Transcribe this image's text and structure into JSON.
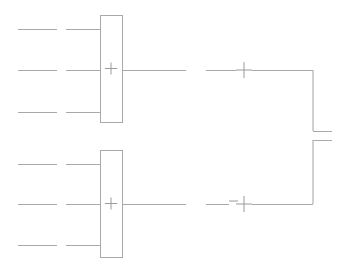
{
  "diagram": {
    "type": "block-diagram",
    "canvas": {
      "width": 346,
      "height": 269,
      "background": "#ffffff"
    },
    "colors": {
      "wire": "#a9a9a9",
      "block_stroke": "#a9a9a9",
      "block_fill": "#ffffff",
      "glyph": "#8a8a8a",
      "background": "#ffffff"
    },
    "stages": [
      {
        "id": "upper",
        "label": "Upper summing stage",
        "summing_block": {
          "name": "upper-summing-block",
          "operator": "+",
          "x": 100,
          "y": 15,
          "width": 22,
          "height": 107
        },
        "inputs": [
          {
            "name": "upper-input-1",
            "row": 1,
            "y": 29,
            "far_segment": {
              "x1": 18,
              "x2": 57
            },
            "near_segment": {
              "x1": 66,
              "x2": 100
            }
          },
          {
            "name": "upper-input-2",
            "row": 2,
            "y": 70,
            "far_segment": {
              "x1": 18,
              "x2": 57
            },
            "near_segment": {
              "x1": 66,
              "x2": 100
            }
          },
          {
            "name": "upper-input-3",
            "row": 3,
            "y": 112,
            "far_segment": {
              "x1": 18,
              "x2": 57
            },
            "near_segment": {
              "x1": 66,
              "x2": 100
            }
          }
        ],
        "output": {
          "name": "upper-output-wire",
          "y": 70,
          "x1": 122,
          "x2": 186
        },
        "junction": {
          "name": "upper-sum-junction",
          "operator": "+",
          "cx": 244,
          "cy": 70,
          "lead_in": {
            "x1": 206,
            "x2": 236
          },
          "lead_out": {
            "x1": 252,
            "x2": 313
          }
        }
      },
      {
        "id": "lower",
        "label": "Lower summing stage",
        "summing_block": {
          "name": "lower-summing-block",
          "operator": "+",
          "x": 100,
          "y": 150,
          "width": 22,
          "height": 107
        },
        "inputs": [
          {
            "name": "lower-input-1",
            "row": 1,
            "y": 164,
            "far_segment": {
              "x1": 18,
              "x2": 57
            },
            "near_segment": {
              "x1": 66,
              "x2": 100
            }
          },
          {
            "name": "lower-input-2",
            "row": 2,
            "y": 204,
            "far_segment": {
              "x1": 18,
              "x2": 57
            },
            "near_segment": {
              "x1": 66,
              "x2": 100
            }
          },
          {
            "name": "lower-input-3",
            "row": 3,
            "y": 245,
            "far_segment": {
              "x1": 18,
              "x2": 57
            },
            "near_segment": {
              "x1": 66,
              "x2": 100
            }
          }
        ],
        "output": {
          "name": "lower-output-wire",
          "y": 204,
          "x1": 122,
          "x2": 186
        },
        "junction": {
          "name": "lower-sum-junction",
          "operator": "+",
          "minus_sign": "−",
          "minus_x": 233,
          "minus_y": 201,
          "cx": 244,
          "cy": 204,
          "lead_in": {
            "x1": 206,
            "x2": 229
          },
          "lead_out": {
            "x1": 252,
            "x2": 313
          }
        }
      }
    ],
    "feedback_bus": {
      "name": "right-feedback-bus",
      "x": 313,
      "upper_segment": {
        "y1": 70,
        "y2": 131
      },
      "lower_segment": {
        "y1": 140,
        "y2": 204
      },
      "break_stubs": [
        {
          "name": "bus-stub-upper",
          "y": 131,
          "x1": 313,
          "x2": 332
        },
        {
          "name": "bus-stub-lower",
          "y": 140,
          "x1": 313,
          "x2": 332
        }
      ]
    }
  }
}
